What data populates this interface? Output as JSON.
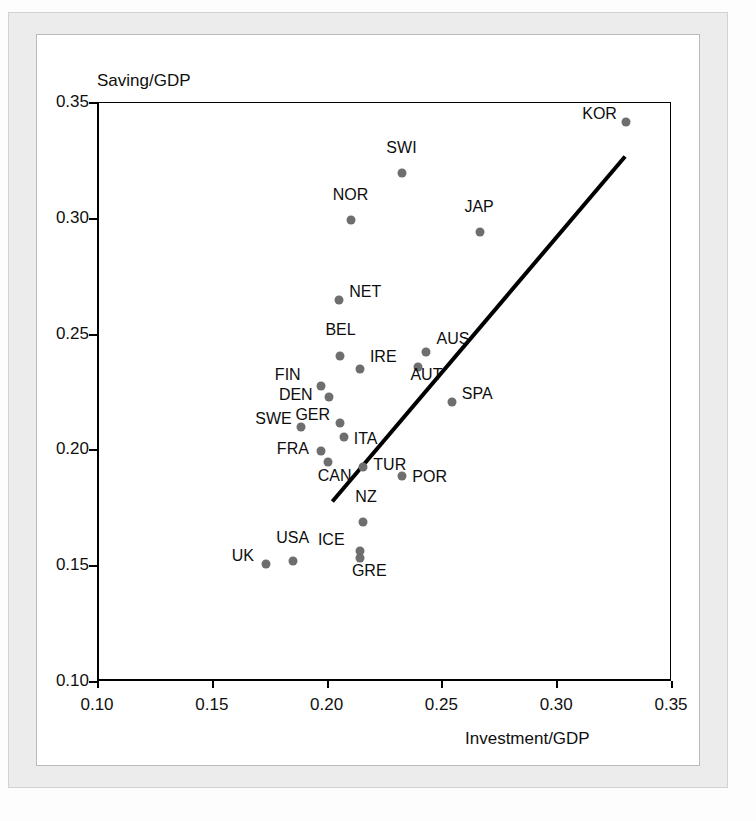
{
  "chart_data": {
    "type": "scatter",
    "title": "",
    "xlabel": "Investment/GDP",
    "ylabel": "Saving/GDP",
    "xlim": [
      0.1,
      0.35
    ],
    "ylim": [
      0.1,
      0.35
    ],
    "xticks": [
      "0.10",
      "0.15",
      "0.20",
      "0.25",
      "0.30",
      "0.35"
    ],
    "yticks": [
      "0.35",
      "0.30",
      "0.25",
      "0.20",
      "0.15",
      "0.10"
    ],
    "xtick_values": [
      0.1,
      0.15,
      0.2,
      0.25,
      0.3,
      0.35
    ],
    "ytick_values": [
      0.35,
      0.3,
      0.25,
      0.2,
      0.15,
      0.1
    ],
    "grid": false,
    "legend": null,
    "point_color": "#6e6e6e",
    "line_color": "#000000",
    "points": [
      {
        "label": "KOR",
        "x": 0.3305,
        "y": 0.3415,
        "lx": -44,
        "ly": -9
      },
      {
        "label": "SWI",
        "x": 0.233,
        "y": 0.3195,
        "lx": -16,
        "ly": -26
      },
      {
        "label": "NOR",
        "x": 0.2105,
        "y": 0.299,
        "lx": -18,
        "ly": -26
      },
      {
        "label": "JAP",
        "x": 0.267,
        "y": 0.294,
        "lx": -16,
        "ly": -26
      },
      {
        "label": "NET",
        "x": 0.2055,
        "y": 0.2645,
        "lx": 10,
        "ly": -9
      },
      {
        "label": "AUS",
        "x": 0.2435,
        "y": 0.242,
        "lx": 10,
        "ly": -14
      },
      {
        "label": "BEL",
        "x": 0.206,
        "y": 0.2405,
        "lx": -15,
        "ly": -27
      },
      {
        "label": "IRE",
        "x": 0.2145,
        "y": 0.2345,
        "lx": 10,
        "ly": -13
      },
      {
        "label": "AUT",
        "x": 0.24,
        "y": 0.2355,
        "lx": -8,
        "ly": 7
      },
      {
        "label": "FIN",
        "x": 0.1975,
        "y": 0.2275,
        "lx": -46,
        "ly": -12
      },
      {
        "label": "DEN",
        "x": 0.201,
        "y": 0.2225,
        "lx": -50,
        "ly": -3
      },
      {
        "label": "SPA",
        "x": 0.2545,
        "y": 0.2205,
        "lx": 10,
        "ly": -9
      },
      {
        "label": "GER",
        "x": 0.206,
        "y": 0.2115,
        "lx": -45,
        "ly": -9
      },
      {
        "label": "SWE",
        "x": 0.189,
        "y": 0.2095,
        "lx": -46,
        "ly": -9
      },
      {
        "label": "ITA",
        "x": 0.2075,
        "y": 0.2055,
        "lx": 10,
        "ly": 1
      },
      {
        "label": "FRA",
        "x": 0.1975,
        "y": 0.1995,
        "lx": -44,
        "ly": -3
      },
      {
        "label": "CAN",
        "x": 0.2005,
        "y": 0.1945,
        "lx": -10,
        "ly": 13
      },
      {
        "label": "TUR",
        "x": 0.216,
        "y": 0.1925,
        "lx": 10,
        "ly": -3
      },
      {
        "label": "POR",
        "x": 0.233,
        "y": 0.1885,
        "lx": 10,
        "ly": 0
      },
      {
        "label": "NZ",
        "x": 0.216,
        "y": 0.1685,
        "lx": -8,
        "ly": -26
      },
      {
        "label": "ICE",
        "x": 0.2145,
        "y": 0.156,
        "lx": -42,
        "ly": -12
      },
      {
        "label": "GRE",
        "x": 0.2145,
        "y": 0.153,
        "lx": -8,
        "ly": 12
      },
      {
        "label": "USA",
        "x": 0.1855,
        "y": 0.152,
        "lx": -17,
        "ly": -24
      },
      {
        "label": "UK",
        "x": 0.1735,
        "y": 0.1505,
        "lx": -34,
        "ly": -9
      }
    ],
    "trend_line": {
      "x0": 0.2025,
      "y0": 0.1775,
      "x1": 0.33,
      "y1": 0.3265,
      "width_px": 4
    }
  }
}
